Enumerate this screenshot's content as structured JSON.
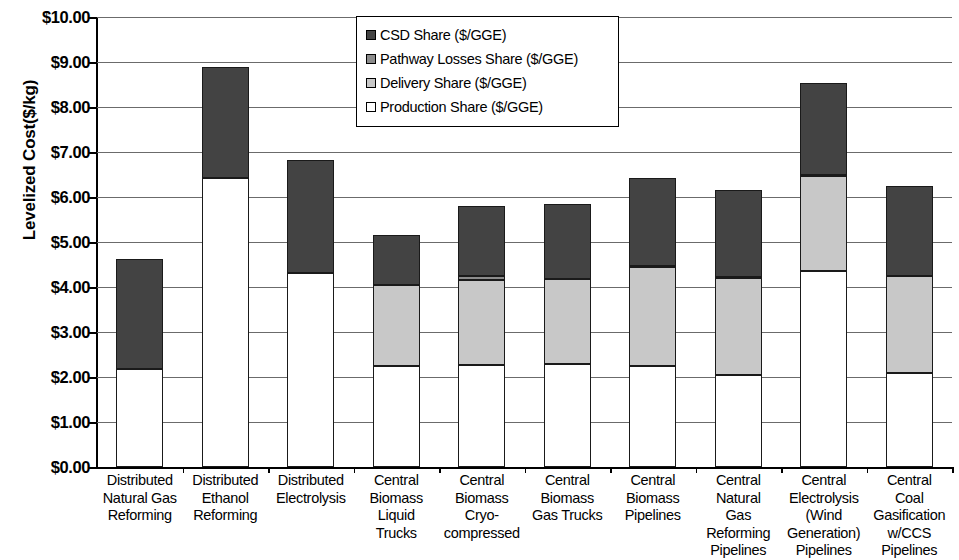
{
  "chart_data": {
    "type": "bar",
    "subtype": "stacked-bar",
    "title": "",
    "xlabel": "",
    "ylabel": "Levelized Cost($/kg)",
    "ylim": [
      0,
      10
    ],
    "ytick_step": 1,
    "ytick_labels": [
      "$0.00",
      "$1.00",
      "$2.00",
      "$3.00",
      "$4.00",
      "$5.00",
      "$6.00",
      "$7.00",
      "$8.00",
      "$9.00",
      "$10.00"
    ],
    "grid": true,
    "legend_position": "top-center",
    "categories": [
      "Distributed Natural Gas Reforming",
      "Distributed Ethanol Reforming",
      "Distributed Electrolysis",
      "Central Biomass Liquid Trucks",
      "Central Biomass Cryo-compressed",
      "Central Biomass Gas Trucks",
      "Central Biomass Pipelines",
      "Central Natural Gas Reforming Pipelines",
      "Central Electrolysis (Wind Generation) Pipelines",
      "Central Coal Gasification w/CCS Pipelines"
    ],
    "category_lines": [
      [
        "Distributed",
        "Natural Gas",
        "Reforming"
      ],
      [
        "Distributed",
        "Ethanol",
        "Reforming"
      ],
      [
        "Distributed",
        "Electrolysis"
      ],
      [
        "Central",
        "Biomass",
        "Liquid",
        "Trucks"
      ],
      [
        "Central",
        "Biomass",
        "Cryo-",
        "compressed"
      ],
      [
        "Central",
        "Biomass",
        "Gas Trucks"
      ],
      [
        "Central",
        "Biomass",
        "Pipelines"
      ],
      [
        "Central",
        "Natural",
        "Gas",
        "Reforming",
        "Pipelines"
      ],
      [
        "Central",
        "Electrolysis",
        "(Wind",
        "Generation)",
        "Pipelines"
      ],
      [
        "Central",
        "Coal",
        "Gasification",
        "w/CCS",
        "Pipelines"
      ]
    ],
    "series": [
      {
        "name": "Production Share ($/GGE)",
        "color": "#ffffff",
        "values": [
          2.18,
          6.42,
          4.31,
          2.25,
          2.26,
          2.28,
          2.25,
          2.05,
          4.35,
          2.09
        ]
      },
      {
        "name": "Delivery Share ($/GGE)",
        "color": "#c8c8c8",
        "values": [
          0.0,
          0.0,
          0.0,
          1.8,
          1.9,
          1.9,
          2.2,
          2.15,
          2.12,
          2.16
        ]
      },
      {
        "name": "Pathway Losses Share ($/GGE)",
        "color": "#8c8c8c",
        "values": [
          0.0,
          0.0,
          0.0,
          0.0,
          0.09,
          0.0,
          0.02,
          0.02,
          0.02,
          0.0
        ]
      },
      {
        "name": "CSD Share ($/GGE)",
        "color": "#434343",
        "values": [
          2.44,
          2.48,
          2.51,
          1.1,
          1.55,
          1.66,
          1.95,
          1.93,
          2.04,
          2.0
        ]
      }
    ],
    "totals": [
      4.62,
      8.9,
      6.82,
      5.15,
      5.8,
      5.84,
      6.42,
      6.15,
      8.53,
      6.25
    ],
    "legend_order": [
      "CSD Share ($/GGE)",
      "Pathway Losses Share ($/GGE)",
      "Delivery Share ($/GGE)",
      "Production Share ($/GGE)"
    ],
    "legend_colors": [
      "#434343",
      "#8c8c8c",
      "#c8c8c8",
      "#ffffff"
    ]
  }
}
